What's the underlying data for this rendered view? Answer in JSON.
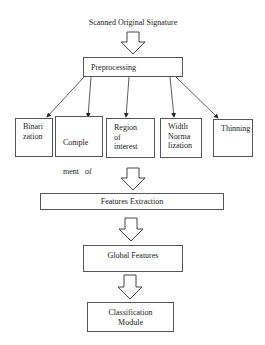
{
  "diagram": {
    "title": "Scanned Original Signature",
    "preprocessing": "Preprocessing",
    "steps": [
      {
        "id": "binarization",
        "lines": [
          "Binari",
          "zation"
        ]
      },
      {
        "id": "complement",
        "lines": [
          "Comple",
          "ment   of",
          "Binary"
        ]
      },
      {
        "id": "region",
        "lines": [
          "Region",
          "of",
          "interest"
        ]
      },
      {
        "id": "width",
        "lines": [
          "Width",
          "Norma",
          "lization"
        ]
      },
      {
        "id": "thinning",
        "lines": [
          "Thinning"
        ]
      }
    ],
    "features_extraction": "Features Extraction",
    "global_features": "Global Features",
    "classification": [
      "Classification",
      "Module"
    ]
  },
  "colors": {
    "stroke": "#555555",
    "text": "#222222",
    "background": "#ffffff"
  }
}
